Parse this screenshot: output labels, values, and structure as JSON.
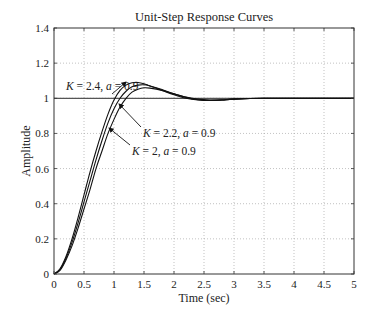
{
  "chart_data": {
    "type": "line",
    "title": "Unit-Step Response Curves",
    "xlabel": "Time (sec)",
    "ylabel": "Amplitude",
    "xlim": [
      0,
      5
    ],
    "ylim": [
      0,
      1.4
    ],
    "xticks": [
      "0",
      "0.5",
      "1",
      "1.5",
      "2",
      "2.5",
      "3",
      "3.5",
      "4",
      "4.5",
      "5"
    ],
    "yticks": [
      "0",
      "0.2",
      "0.4",
      "0.6",
      "0.8",
      "1",
      "1.2",
      "1.4"
    ],
    "grid": true,
    "reference_line": 1,
    "series": [
      {
        "name": "K = 2.4, a = 0.9",
        "x": [
          0,
          0.1,
          0.2,
          0.3,
          0.4,
          0.5,
          0.6,
          0.7,
          0.8,
          0.9,
          1.0,
          1.1,
          1.2,
          1.3,
          1.4,
          1.5,
          1.6,
          1.8,
          2.0,
          2.2,
          2.4,
          2.6,
          2.8,
          3.0,
          3.5,
          4.0,
          5.0
        ],
        "y": [
          0,
          0.03,
          0.1,
          0.2,
          0.32,
          0.45,
          0.58,
          0.7,
          0.81,
          0.91,
          0.99,
          1.045,
          1.075,
          1.088,
          1.09,
          1.083,
          1.07,
          1.045,
          1.02,
          1.0,
          0.99,
          0.987,
          0.99,
          0.995,
          1.0,
          1.0,
          1.0
        ]
      },
      {
        "name": "K = 2.2, a = 0.9",
        "x": [
          0,
          0.1,
          0.2,
          0.3,
          0.4,
          0.5,
          0.6,
          0.7,
          0.8,
          0.9,
          1.0,
          1.1,
          1.2,
          1.3,
          1.4,
          1.5,
          1.6,
          1.8,
          2.0,
          2.2,
          2.4,
          2.6,
          2.8,
          3.0,
          3.5,
          4.0,
          5.0
        ],
        "y": [
          0,
          0.025,
          0.09,
          0.18,
          0.29,
          0.41,
          0.53,
          0.65,
          0.76,
          0.86,
          0.94,
          1.0,
          1.04,
          1.065,
          1.075,
          1.077,
          1.07,
          1.05,
          1.025,
          1.005,
          0.992,
          0.988,
          0.99,
          0.995,
          1.0,
          1.0,
          1.0
        ]
      },
      {
        "name": "K = 2, a = 0.9",
        "x": [
          0,
          0.1,
          0.2,
          0.3,
          0.4,
          0.5,
          0.6,
          0.7,
          0.8,
          0.9,
          1.0,
          1.1,
          1.2,
          1.3,
          1.4,
          1.5,
          1.6,
          1.8,
          2.0,
          2.2,
          2.4,
          2.6,
          2.8,
          3.0,
          3.5,
          4.0,
          5.0
        ],
        "y": [
          0,
          0.02,
          0.08,
          0.16,
          0.26,
          0.37,
          0.48,
          0.6,
          0.7,
          0.8,
          0.88,
          0.95,
          1.0,
          1.035,
          1.052,
          1.06,
          1.058,
          1.045,
          1.025,
          1.007,
          0.995,
          0.99,
          0.991,
          0.995,
          1.0,
          1.0,
          1.0
        ]
      }
    ],
    "annotations": [
      {
        "text_k": "K",
        "text_rest": " = 2.4, ",
        "text_a": "a",
        "text_val": " = 0.9",
        "series": 0
      },
      {
        "text_k": "K",
        "text_rest": " = 2.2, ",
        "text_a": "a",
        "text_val": " = 0.9",
        "series": 1
      },
      {
        "text_k": "K",
        "text_rest": " = 2, ",
        "text_a": "a",
        "text_val": " = 0.9",
        "series": 2
      }
    ]
  }
}
